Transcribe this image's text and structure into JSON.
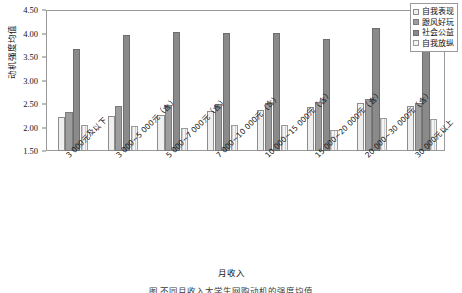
{
  "chart_data": {
    "type": "bar",
    "title": "",
    "xlabel": "月收入",
    "ylabel": "动机强度均值",
    "ylim": [
      1.5,
      4.5
    ],
    "yticks": [
      1.5,
      2.0,
      2.5,
      3.0,
      3.5,
      4.0,
      4.5
    ],
    "ytick_labels": [
      "1.50",
      "2.00",
      "2.50",
      "3.00",
      "3.50",
      "4.00",
      "4.50"
    ],
    "grid": false,
    "legend_position": "top-right",
    "categories": [
      "3 000元及以下",
      "3 000~5 000元（含）",
      "5 000~7 000元（含）",
      "7 000~10 000元（含）",
      "10 000~15 000元（含）",
      "15 000~20 000元（含）",
      "20 000~30 000元（含）",
      "30 000元以上"
    ],
    "series": [
      {
        "name": "自我表现",
        "color": "#efefef",
        "values": [
          2.23,
          2.24,
          2.27,
          2.35,
          2.38,
          2.44,
          2.53,
          2.45
        ]
      },
      {
        "name": "跟风好玩",
        "color": "#9d9d9d",
        "values": [
          2.32,
          2.46,
          2.48,
          2.5,
          2.52,
          2.55,
          2.6,
          2.52
        ]
      },
      {
        "name": "社会公益",
        "color": "#8a8a8a",
        "values": [
          3.67,
          3.96,
          4.03,
          4.01,
          4.02,
          3.89,
          4.12,
          4.04
        ]
      },
      {
        "name": "自我放纵",
        "color": "#f4f4f4",
        "values": [
          2.05,
          2.03,
          1.98,
          2.05,
          2.06,
          1.94,
          2.2,
          2.18
        ]
      }
    ]
  },
  "legend": {
    "items": [
      {
        "label": "自我表现"
      },
      {
        "label": "跟风好玩"
      },
      {
        "label": "社会公益"
      },
      {
        "label": "自我放纵"
      }
    ]
  },
  "axis": {
    "y_title": "动机强度均值",
    "x_title": "月收入"
  },
  "caption": {
    "text": "图     不同月收入大学生网购动机的强度均值"
  }
}
